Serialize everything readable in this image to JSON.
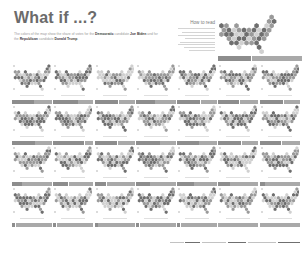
{
  "header": {
    "title": "What if ...?",
    "intro": {
      "p1_before": "The colors of the map show the share of votes for the ",
      "dem_label": "Democratic",
      "p1_mid1": " candidate ",
      "dem_candidate": "Joe Biden",
      "p1_mid2": " and for the ",
      "rep_label": "Republican",
      "p1_mid3": " candidate ",
      "rep_candidate": "Donald Trump",
      "p1_after": "."
    }
  },
  "legend": {
    "title": "How to read",
    "bar": {
      "dem_share": 40,
      "rep_share": 60
    }
  },
  "colors": {
    "background": "#ffffff",
    "title": "#6b6b6b",
    "dem_bar": "#8d8d8d",
    "rep_bar": "#a9a9a9",
    "hex_dark": "#6e6e6e",
    "hex_mid": "#9a9a9a",
    "hex_light": "#d0d0d0"
  },
  "grid": {
    "rows": 4,
    "columns": 7,
    "scenarios": [
      {
        "dem_share": 55
      },
      {
        "dem_share": 62
      },
      {
        "dem_share": 60
      },
      {
        "dem_share": 48
      },
      {
        "dem_share": 58
      },
      {
        "dem_share": 52
      },
      {
        "dem_share": 60
      },
      {
        "dem_share": 58
      },
      {
        "dem_share": 78
      },
      {
        "dem_share": 58
      },
      {
        "dem_share": 60
      },
      {
        "dem_share": 55
      },
      {
        "dem_share": 57
      },
      {
        "dem_share": 55
      },
      {
        "dem_share": 25
      },
      {
        "dem_share": 38
      },
      {
        "dem_share": 30
      },
      {
        "dem_share": 35
      },
      {
        "dem_share": 42
      },
      {
        "dem_share": 28
      },
      {
        "dem_share": 12
      },
      {
        "dem_share": 8
      },
      {
        "dem_share": 8
      },
      {
        "dem_share": 8
      },
      {
        "dem_share": 8
      },
      {
        "dem_share": 8
      },
      {
        "dem_share": 0
      },
      {
        "dem_share": 0
      }
    ]
  }
}
